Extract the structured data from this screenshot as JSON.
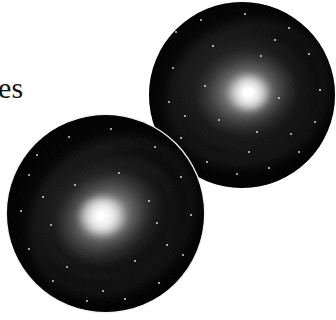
{
  "figure": {
    "background_color": "#ffffff",
    "caption_fragment": "es",
    "caption_color": "#141414",
    "width": 336,
    "height": 320,
    "kind": "astronomical-photographic-plates"
  },
  "plates": [
    {
      "id": "upper",
      "name": "spiral-galaxy-plate-upper-right",
      "shape": "circle",
      "center_x": 242,
      "center_y": 95,
      "radius": 93,
      "field_color": "#030303",
      "core_color": "#ffffff",
      "core_x": 249,
      "core_y": 96,
      "z_order": 2,
      "rim": "none",
      "stars": [
        {
          "x": 27,
          "y": 30,
          "r": 1.0
        },
        {
          "x": 52,
          "y": 18,
          "r": 0.9
        },
        {
          "x": 96,
          "y": 12,
          "r": 1.1
        },
        {
          "x": 140,
          "y": 26,
          "r": 0.9
        },
        {
          "x": 160,
          "y": 52,
          "r": 1.0
        },
        {
          "x": 171,
          "y": 88,
          "r": 1.2
        },
        {
          "x": 166,
          "y": 120,
          "r": 0.9
        },
        {
          "x": 150,
          "y": 150,
          "r": 1.0
        },
        {
          "x": 120,
          "y": 166,
          "r": 1.1
        },
        {
          "x": 88,
          "y": 172,
          "r": 0.9
        },
        {
          "x": 58,
          "y": 160,
          "r": 1.0
        },
        {
          "x": 32,
          "y": 136,
          "r": 0.9
        },
        {
          "x": 20,
          "y": 100,
          "r": 1.0
        },
        {
          "x": 24,
          "y": 66,
          "r": 0.9
        },
        {
          "x": 64,
          "y": 44,
          "r": 1.3
        },
        {
          "x": 112,
          "y": 54,
          "r": 1.0
        },
        {
          "x": 130,
          "y": 96,
          "r": 0.9
        },
        {
          "x": 108,
          "y": 130,
          "r": 1.1
        },
        {
          "x": 70,
          "y": 118,
          "r": 0.9
        },
        {
          "x": 56,
          "y": 84,
          "r": 1.0
        },
        {
          "x": 142,
          "y": 132,
          "r": 0.9
        },
        {
          "x": 100,
          "y": 150,
          "r": 0.8
        },
        {
          "x": 36,
          "y": 114,
          "r": 0.8
        },
        {
          "x": 126,
          "y": 38,
          "r": 0.8
        }
      ]
    },
    {
      "id": "lower",
      "name": "spiral-galaxy-plate-lower-left",
      "shape": "circle",
      "center_x": 105,
      "center_y": 213,
      "radius": 98,
      "field_color": "#030303",
      "core_color": "#ffffff",
      "core_x": 99,
      "core_y": 217,
      "z_order": 3,
      "rim": "#f2f2f2",
      "stars": [
        {
          "x": 30,
          "y": 40,
          "r": 1.0
        },
        {
          "x": 62,
          "y": 22,
          "r": 0.9
        },
        {
          "x": 104,
          "y": 14,
          "r": 1.0
        },
        {
          "x": 148,
          "y": 32,
          "r": 0.9
        },
        {
          "x": 174,
          "y": 62,
          "r": 1.1
        },
        {
          "x": 184,
          "y": 100,
          "r": 1.0
        },
        {
          "x": 176,
          "y": 140,
          "r": 0.9
        },
        {
          "x": 152,
          "y": 168,
          "r": 1.0
        },
        {
          "x": 118,
          "y": 184,
          "r": 1.2
        },
        {
          "x": 80,
          "y": 186,
          "r": 0.9
        },
        {
          "x": 46,
          "y": 166,
          "r": 1.0
        },
        {
          "x": 22,
          "y": 134,
          "r": 0.9
        },
        {
          "x": 14,
          "y": 96,
          "r": 1.1
        },
        {
          "x": 22,
          "y": 60,
          "r": 0.9
        },
        {
          "x": 142,
          "y": 86,
          "r": 1.2
        },
        {
          "x": 150,
          "y": 108,
          "r": 1.0
        },
        {
          "x": 128,
          "y": 146,
          "r": 1.0
        },
        {
          "x": 60,
          "y": 152,
          "r": 0.9
        },
        {
          "x": 44,
          "y": 110,
          "r": 0.9
        },
        {
          "x": 68,
          "y": 70,
          "r": 1.0
        },
        {
          "x": 112,
          "y": 58,
          "r": 0.9
        },
        {
          "x": 96,
          "y": 176,
          "r": 0.9
        },
        {
          "x": 160,
          "y": 130,
          "r": 0.8
        },
        {
          "x": 36,
          "y": 82,
          "r": 0.8
        }
      ]
    }
  ]
}
